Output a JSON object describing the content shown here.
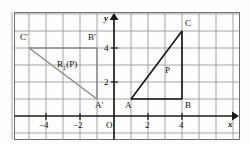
{
  "figure": {
    "colors": {
      "grid": "#9a9a9a",
      "axis": "#1a1a1a",
      "object": "#111111",
      "image": "#8c8c8c",
      "frame": "#6e6e6e",
      "background": "#fdfdfd"
    },
    "axes": {
      "x_label": "x",
      "y_label": "y",
      "origin_label": "O",
      "x_ticks": [
        {
          "value": -4,
          "label": "−4"
        },
        {
          "value": -2,
          "label": "−2"
        },
        {
          "value": 2,
          "label": "2"
        },
        {
          "value": 4,
          "label": "4"
        }
      ],
      "y_ticks": [
        {
          "value": 2,
          "label": "2"
        },
        {
          "value": 4,
          "label": "4"
        }
      ],
      "x_range": [
        -6,
        7
      ],
      "y_range": [
        0,
        6
      ],
      "grid": "on",
      "unit_px": 17
    },
    "object_figure": {
      "name": "triangle-abc",
      "vertices": [
        {
          "label": "A",
          "x": 1,
          "y": 1
        },
        {
          "label": "B",
          "x": 4,
          "y": 1
        },
        {
          "label": "C",
          "x": 4,
          "y": 5
        }
      ],
      "interior_label": "P"
    },
    "image_figure": {
      "name": "triangle-a-prime-b-prime-c-prime",
      "vertices": [
        {
          "label": "A′",
          "x": -1,
          "y": 1
        },
        {
          "label": "B′",
          "x": -1,
          "y": 4
        },
        {
          "label": "C′",
          "x": -5,
          "y": 4
        }
      ],
      "interior_label_html": "R<sub>1</sub>(P)",
      "interior_label": "R1(P)"
    }
  }
}
